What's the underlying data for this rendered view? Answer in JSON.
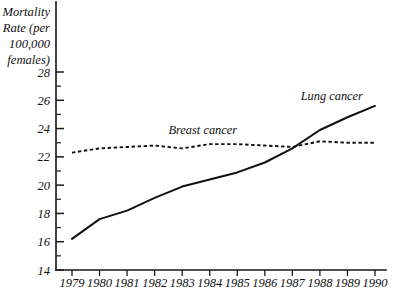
{
  "chart_data": {
    "type": "line",
    "title": "",
    "xlabel": "",
    "ylabel": "Mortality Rate (per 100,000 females)",
    "ylabel_lines": [
      "Mortality",
      "Rate (per",
      "100,000",
      "females)"
    ],
    "x": [
      1979,
      1980,
      1981,
      1982,
      1983,
      1984,
      1985,
      1986,
      1987,
      1988,
      1989,
      1990
    ],
    "categories": [
      "1979",
      "1980",
      "1981",
      "1982",
      "1983",
      "1984",
      "1985",
      "1986",
      "1987",
      "1988",
      "1989",
      "1990"
    ],
    "xlim": [
      1979,
      1990
    ],
    "ylim": [
      14,
      29
    ],
    "yticks": [
      14,
      16,
      18,
      20,
      22,
      24,
      26,
      28
    ],
    "ytick_labels": [
      "14",
      "16",
      "18",
      "20",
      "22",
      "24",
      "26",
      "28"
    ],
    "yminor_ticks": [
      15,
      17,
      19,
      21,
      23,
      25,
      27
    ],
    "grid": false,
    "legend_position": "inline-annotations",
    "series": [
      {
        "name": "Lung cancer",
        "style": "solid",
        "color": "#111111",
        "values": [
          16.2,
          17.6,
          18.2,
          19.1,
          19.9,
          20.4,
          20.9,
          21.6,
          22.6,
          23.9,
          24.8,
          25.6
        ]
      },
      {
        "name": "Breast cancer",
        "style": "dashed",
        "color": "#111111",
        "values": [
          22.3,
          22.6,
          22.7,
          22.8,
          22.6,
          22.9,
          22.9,
          22.8,
          22.7,
          23.1,
          23.0,
          23.0
        ]
      }
    ],
    "annotations": [
      {
        "text": "Lung cancer",
        "x": 1987.3,
        "y": 26.0
      },
      {
        "text": "Breast cancer",
        "x": 1982.5,
        "y": 23.6
      }
    ]
  }
}
